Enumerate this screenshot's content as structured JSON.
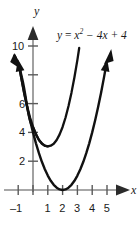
{
  "figure": {
    "background_color": "#ffffff",
    "width": 140,
    "height": 229
  },
  "equation": {
    "lhs": "y",
    "equals": " = ",
    "term1_base": "x",
    "term1_exponent": "2",
    "term2": " − 4x",
    "term3": " + 4",
    "full_text": "y = x² − 4x + 4"
  },
  "axes": {
    "x_axis_name": "x",
    "y_axis_name": "y",
    "axis_color": "#8a8a8a",
    "curve_color": "#111111",
    "x_ticks": [
      {
        "value": -1,
        "label": "–1"
      },
      {
        "value": 0,
        "label": ""
      },
      {
        "value": 1,
        "label": "1"
      },
      {
        "value": 2,
        "label": "2"
      },
      {
        "value": 3,
        "label": "3"
      },
      {
        "value": 4,
        "label": "4"
      },
      {
        "value": 5,
        "label": "5"
      }
    ],
    "y_ticks": [
      {
        "value": 2,
        "label": "2"
      },
      {
        "value": 4,
        "label": "4"
      },
      {
        "value": 6,
        "label": "6"
      },
      {
        "value": 8,
        "label": ""
      },
      {
        "value": 10,
        "label": "10"
      }
    ],
    "x_range": [
      -1.6,
      6.4
    ],
    "y_range": [
      -0.7,
      11.4
    ]
  },
  "chart_data": {
    "type": "line",
    "title": "",
    "xlabel": "x",
    "ylabel": "y",
    "annotations": [
      "y = x² − 4x + 4"
    ],
    "grid": false,
    "legend": "none",
    "xlim": [
      -1.6,
      6.4
    ],
    "ylim": [
      -0.7,
      11.4
    ],
    "xticks": [
      -1,
      0,
      1,
      2,
      3,
      4,
      5
    ],
    "xticklabels": [
      "–1",
      "",
      "1",
      "2",
      "3",
      "4",
      "5"
    ],
    "yticks": [
      2,
      4,
      6,
      8,
      10
    ],
    "yticklabels": [
      "2",
      "4",
      "6",
      "",
      "10"
    ],
    "series": [
      {
        "name": "y = x^2 - 4x + 4",
        "equation": "y = x^2 - 4x + 4",
        "vertex": [
          2,
          0
        ],
        "y_intercept": [
          0,
          4
        ],
        "arrowheads": [
          "start",
          "end"
        ],
        "x": [
          -0.95,
          -0.8,
          -0.6,
          -0.4,
          -0.2,
          0,
          0.2,
          0.4,
          0.6,
          0.8,
          1,
          1.2,
          1.4,
          1.6,
          1.8,
          2,
          2.2,
          2.4,
          2.6,
          2.8,
          3,
          3.2,
          3.4,
          3.6,
          3.8,
          4,
          4.2,
          4.4,
          4.6,
          4.8,
          4.95
        ],
        "y": [
          8.7,
          7.84,
          6.76,
          5.76,
          4.84,
          4,
          3.24,
          2.56,
          1.96,
          1.44,
          1,
          0.64,
          0.36,
          0.16,
          0.04,
          0,
          0.04,
          0.16,
          0.36,
          0.64,
          1,
          1.44,
          1.96,
          2.56,
          3.24,
          4,
          4.84,
          5.76,
          6.76,
          7.84,
          8.7
        ]
      }
    ]
  }
}
